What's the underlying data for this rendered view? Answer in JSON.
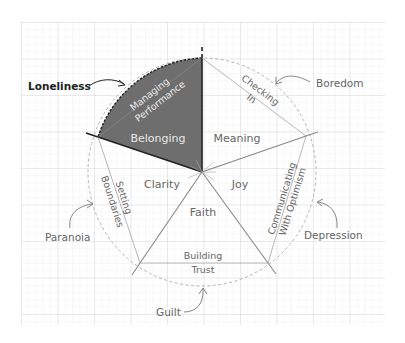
{
  "diagram": {
    "colors": {
      "grid_minor": "#e4e4e4",
      "grid_major": "#d2d2d2",
      "line": "#8a8a8a",
      "dash_circle": "#aaaaaa",
      "highlight_fill": "#6e6e6e",
      "highlight_stroke": "#222222",
      "text": "#666666"
    },
    "sectors": [
      {
        "id": "belonging",
        "label": "Belonging",
        "highlighted": true
      },
      {
        "id": "meaning",
        "label": "Meaning"
      },
      {
        "id": "joy",
        "label": "Joy"
      },
      {
        "id": "faith",
        "label": "Faith"
      },
      {
        "id": "clarity",
        "label": "Clarity"
      }
    ],
    "edges": [
      {
        "id": "managing-performance",
        "lines": [
          "Managing",
          "Performance"
        ]
      },
      {
        "id": "checking-in",
        "lines": [
          "Checking",
          "In"
        ]
      },
      {
        "id": "communicating-with-optimism",
        "lines": [
          "Communicating",
          "With Optimism"
        ]
      },
      {
        "id": "building-trust",
        "lines": [
          "Building",
          "Trust"
        ]
      },
      {
        "id": "setting-boundaries",
        "lines": [
          "Setting",
          "Boundaries"
        ]
      }
    ],
    "outer_labels": [
      {
        "id": "loneliness",
        "label": "Loneliness",
        "emphasized": true
      },
      {
        "id": "boredom",
        "label": "Boredom"
      },
      {
        "id": "depression",
        "label": "Depression"
      },
      {
        "id": "guilt",
        "label": "Guilt"
      },
      {
        "id": "paranoia",
        "label": "Paranoia"
      }
    ]
  }
}
